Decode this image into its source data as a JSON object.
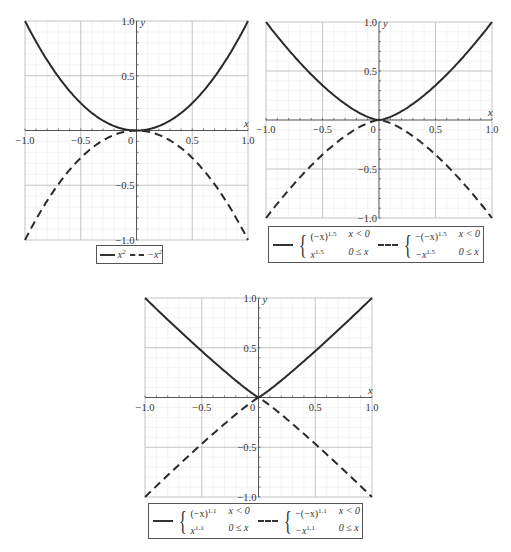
{
  "chart_data": [
    {
      "type": "line",
      "title": "",
      "xlabel": "x",
      "ylabel": "y",
      "xlim": [
        -1.0,
        1.0
      ],
      "ylim": [
        -1.0,
        1.0
      ],
      "grid": true,
      "x_ticks": [
        "-1.0",
        "-0.5",
        "0",
        "0.5",
        "1.0"
      ],
      "y_ticks": [
        "1.0",
        "0.5",
        "-0.5",
        "-1.0"
      ],
      "legend_position": "bottom",
      "series": [
        {
          "name": "x^2",
          "style": "solid",
          "x": [
            -1,
            -0.75,
            -0.5,
            -0.25,
            0,
            0.25,
            0.5,
            0.75,
            1
          ],
          "values": [
            1,
            0.5625,
            0.25,
            0.0625,
            0,
            0.0625,
            0.25,
            0.5625,
            1
          ]
        },
        {
          "name": "-x^2",
          "style": "dashed",
          "x": [
            -1,
            -0.75,
            -0.5,
            -0.25,
            0,
            0.25,
            0.5,
            0.75,
            1
          ],
          "values": [
            -1,
            -0.5625,
            -0.25,
            -0.0625,
            0,
            -0.0625,
            -0.25,
            -0.5625,
            -1
          ]
        }
      ],
      "exponent": 2
    },
    {
      "type": "line",
      "title": "",
      "xlabel": "x",
      "ylabel": "y",
      "xlim": [
        -1.0,
        1.0
      ],
      "ylim": [
        -1.0,
        1.0
      ],
      "grid": true,
      "x_ticks": [
        "-1.0",
        "-0.5",
        "0",
        "0.5",
        "1.0"
      ],
      "y_ticks": [
        "1.0",
        "0.5",
        "-0.5",
        "-1.0"
      ],
      "legend_position": "bottom",
      "series": [
        {
          "name": "{(-x)^1.5, x<0; x^1.5, 0≤x}",
          "style": "solid",
          "x": [
            -1,
            -0.75,
            -0.5,
            -0.25,
            0,
            0.25,
            0.5,
            0.75,
            1
          ],
          "values": [
            1,
            0.65,
            0.354,
            0.125,
            0,
            0.125,
            0.354,
            0.65,
            1
          ]
        },
        {
          "name": "{-(-x)^1.5, x<0; -x^1.5, 0≤x}",
          "style": "dashed",
          "x": [
            -1,
            -0.75,
            -0.5,
            -0.25,
            0,
            0.25,
            0.5,
            0.75,
            1
          ],
          "values": [
            -1,
            -0.65,
            -0.354,
            -0.125,
            0,
            -0.125,
            -0.354,
            -0.65,
            -1
          ]
        }
      ],
      "exponent": 1.5
    },
    {
      "type": "line",
      "title": "",
      "xlabel": "x",
      "ylabel": "y",
      "xlim": [
        -1.0,
        1.0
      ],
      "ylim": [
        -1.0,
        1.0
      ],
      "grid": true,
      "x_ticks": [
        "-1.0",
        "-0.5",
        "0",
        "0.5",
        "1.0"
      ],
      "y_ticks": [
        "1.0",
        "0.5",
        "-0.5",
        "-1.0"
      ],
      "legend_position": "bottom",
      "series": [
        {
          "name": "{(-x)^1.1, x<0; x^1.1, 0≤x}",
          "style": "solid",
          "x": [
            -1,
            -0.75,
            -0.5,
            -0.25,
            0,
            0.25,
            0.5,
            0.75,
            1
          ],
          "values": [
            1,
            0.729,
            0.467,
            0.218,
            0,
            0.218,
            0.467,
            0.729,
            1
          ]
        },
        {
          "name": "{-(-x)^1.1, x<0; -x^1.1, 0≤x}",
          "style": "dashed",
          "x": [
            -1,
            -0.75,
            -0.5,
            -0.25,
            0,
            0.25,
            0.5,
            0.75,
            1
          ],
          "values": [
            -1,
            -0.729,
            -0.467,
            -0.218,
            0,
            -0.218,
            -0.467,
            -0.729,
            -1
          ]
        }
      ],
      "exponent": 1.1
    }
  ],
  "plots": [
    {
      "legend": {
        "solid_label": "x",
        "solid_sup": "2",
        "dashed_label": "−x",
        "dashed_sup": "2"
      }
    },
    {
      "legend": {
        "solid": {
          "r1_expr": "(−x)",
          "r1_sup": "1.5",
          "r1_cond": "x < 0",
          "r2_expr": "x",
          "r2_sup": "1.5",
          "r2_cond": "0 ≤ x"
        },
        "dashed": {
          "r1_expr": "−(−x)",
          "r1_sup": "1.5",
          "r1_cond": "x < 0",
          "r2_expr": "−x",
          "r2_sup": "1.5",
          "r2_cond": "0 ≤ x"
        }
      }
    },
    {
      "legend": {
        "solid": {
          "r1_expr": "(−x)",
          "r1_sup": "1.1",
          "r1_cond": "x < 0",
          "r2_expr": "x",
          "r2_sup": "1.1",
          "r2_cond": "0 ≤ x"
        },
        "dashed": {
          "r1_expr": "−(−x)",
          "r1_sup": "1.1",
          "r1_cond": "x < 0",
          "r2_expr": "−x",
          "r2_sup": "1.1",
          "r2_cond": "0 ≤ x"
        }
      }
    }
  ],
  "colors": {
    "curve": "#2a2a2a",
    "grid_major": "#bdbdbd",
    "grid_minor": "#ececec",
    "axis": "#555555"
  }
}
